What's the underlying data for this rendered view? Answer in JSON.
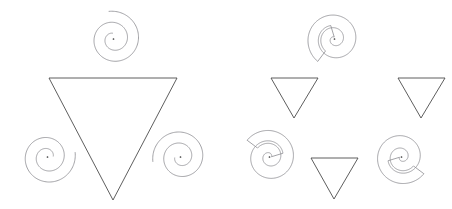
{
  "figure": {
    "background_color": "#ffffff",
    "line_color": "#4c4c4c",
    "spiral_color": "#8c8c90",
    "dot_color": "#3a3a3a",
    "width": 452,
    "height": 209
  },
  "panels": [
    {
      "id": "left-panel",
      "name": "single-line-spiral-inducers-with-one-large-triangle",
      "label": "",
      "origin_x": 0,
      "description": "One large downward-pointing triangle whose corners are overlapped by three thin single-line spiral inducers",
      "triangles": [
        {
          "name": "large-inverted-triangle",
          "points": "49,78 177,78 113,200",
          "size": "large",
          "orientation": "point-down",
          "occluded": true
        }
      ],
      "inducers": [
        {
          "name": "spiral-inducer-top",
          "type": "single-line-spiral",
          "cx": 113.5,
          "cy": 39.0,
          "r_outer": 28.0,
          "turns": 2.0,
          "gap_direction_deg": 90,
          "has_center_dot": true
        },
        {
          "name": "spiral-inducer-bottom-left",
          "type": "single-line-spiral",
          "cx": 47.5,
          "cy": 157.0,
          "r_outer": 28.0,
          "turns": 2.0,
          "gap_direction_deg": 0,
          "has_center_dot": true
        },
        {
          "name": "spiral-inducer-bottom-right",
          "type": "single-line-spiral",
          "cx": 180.5,
          "cy": 157.0,
          "r_outer": 28.0,
          "turns": 2.0,
          "gap_direction_deg": 180,
          "has_center_dot": true
        }
      ]
    },
    {
      "id": "right-panel",
      "name": "outlined-spiral-ribbon-inducers-with-three-small-triangles",
      "label": "",
      "origin_x": 226,
      "description": "Three small downward-pointing triangles with three outlined spiral-ribbon C-shaped inducers",
      "triangles": [
        {
          "name": "small-inverted-triangle-top-left",
          "points": "271,78 318,78 294,118",
          "size": "small",
          "orientation": "point-down",
          "occluded": false
        },
        {
          "name": "small-inverted-triangle-top-right",
          "points": "398,78 445,78 421,118",
          "size": "small",
          "orientation": "point-down",
          "occluded": false
        },
        {
          "name": "small-inverted-triangle-bottom-center",
          "points": "311,158 358,158 334,199",
          "size": "small",
          "orientation": "point-down",
          "occluded": false
        }
      ],
      "inducers": [
        {
          "name": "spiral-ribbon-inducer-top",
          "type": "outlined-spiral-ribbon",
          "cx": 334.5,
          "cy": 39.0,
          "r_outer": 28.0,
          "turns": 1.35,
          "band_width": 13.0,
          "gap_direction_deg": 90,
          "has_center_dot": true
        },
        {
          "name": "spiral-ribbon-inducer-bottom-left",
          "type": "outlined-spiral-ribbon",
          "cx": 269.5,
          "cy": 157.0,
          "r_outer": 28.0,
          "turns": 1.35,
          "band_width": 13.0,
          "gap_direction_deg": 0,
          "has_center_dot": true
        },
        {
          "name": "spiral-ribbon-inducer-bottom-right",
          "type": "outlined-spiral-ribbon",
          "cx": 401.5,
          "cy": 157.0,
          "r_outer": 28.0,
          "turns": 1.35,
          "band_width": 13.0,
          "gap_direction_deg": 180,
          "has_center_dot": true
        }
      ]
    }
  ]
}
